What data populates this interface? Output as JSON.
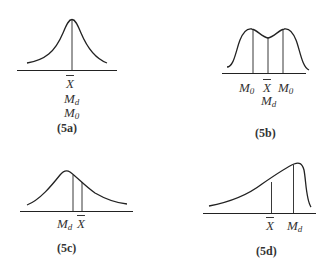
{
  "panels": [
    {
      "id": "5a",
      "caption": "(5a)",
      "shape": "symmetric unimodal",
      "labels": {
        "mean": "X",
        "median": "M",
        "median_sub": "d",
        "mode": "M",
        "mode_sub": "0"
      }
    },
    {
      "id": "5b",
      "caption": "(5b)",
      "shape": "bimodal",
      "labels": {
        "mode_left": "M",
        "mode_left_sub": "0",
        "mean": "X",
        "mode_right": "M",
        "mode_right_sub": "0",
        "median": "M",
        "median_sub": "d"
      }
    },
    {
      "id": "5c",
      "caption": "(5c)",
      "shape": "positively skewed",
      "labels": {
        "median": "M",
        "median_sub": "d",
        "mean": "X"
      }
    },
    {
      "id": "5d",
      "caption": "(5d)",
      "shape": "negatively skewed",
      "labels": {
        "mean": "X",
        "median": "M",
        "median_sub": "d"
      }
    }
  ]
}
